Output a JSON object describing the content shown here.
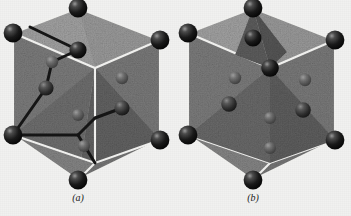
{
  "figure": {
    "kind": "crystal-structure-illustration",
    "background_color": "#f1f1f0",
    "panels": [
      {
        "id": "a",
        "caption": "(a)",
        "description": "Hexagonal unit cell with bonded zigzag atom chains",
        "has_bonds": true,
        "origin_x": 0,
        "corner_atoms": 8,
        "interior_atoms": 6
      },
      {
        "id": "b",
        "caption": "(b)",
        "description": "Hexagonal unit cell with unbonded interior atoms",
        "has_bonds": false,
        "origin_x": 175,
        "corner_atoms": 8,
        "interior_atoms": 6
      }
    ],
    "colors": {
      "atom_dark": "#131313",
      "atom_highlight": "#8f8f8f",
      "face_light": "#b9b9b9",
      "face_mid": "#8a8a8a",
      "face_dark": "#6e6e6e",
      "face_darkest": "#5a5a5a",
      "edge_light": "#f4f4f2",
      "bond": "#1c1c1c"
    }
  }
}
